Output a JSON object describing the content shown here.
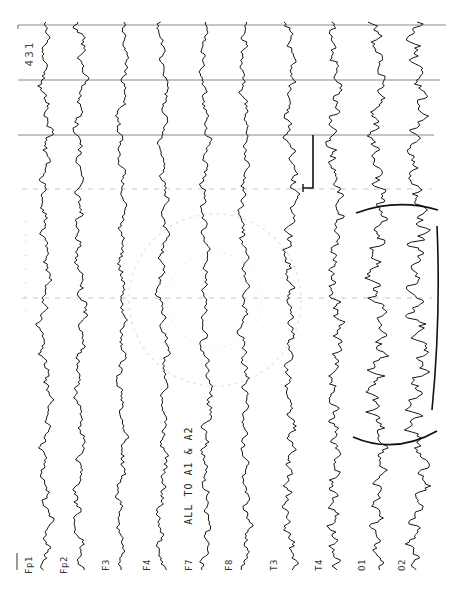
{
  "page": {
    "page_number": "431",
    "montage_label": "ALL TO A1 & A2",
    "faint_note": "· · ·  · ·  ·· ·"
  },
  "channels": [
    {
      "label": "Fp1",
      "x": 45,
      "amp": 4.5,
      "freq": 1.0,
      "seed": 11
    },
    {
      "label": "Fp2",
      "x": 80,
      "amp": 4.5,
      "freq": 0.9,
      "seed": 23
    },
    {
      "label": "F3",
      "x": 122,
      "amp": 3.8,
      "freq": 0.8,
      "seed": 37
    },
    {
      "label": "F4",
      "x": 163,
      "amp": 3.8,
      "freq": 0.8,
      "seed": 41
    },
    {
      "label": "F7",
      "x": 205,
      "amp": 3.6,
      "freq": 1.1,
      "seed": 53
    },
    {
      "label": "F8",
      "x": 245,
      "amp": 3.8,
      "freq": 1.0,
      "seed": 67
    },
    {
      "label": "T3",
      "x": 290,
      "amp": 4.6,
      "freq": 1.3,
      "seed": 79
    },
    {
      "label": "T4",
      "x": 335,
      "amp": 5.2,
      "freq": 1.4,
      "seed": 83
    },
    {
      "label": "O1",
      "x": 378,
      "amp": 6.2,
      "freq": 1.3,
      "seed": 97
    },
    {
      "label": "O2",
      "x": 418,
      "amp": 7.0,
      "freq": 1.3,
      "seed": 101
    }
  ],
  "grid": {
    "solid_lines_y": [
      25,
      80,
      135
    ],
    "dashed_lines_y": [
      189,
      298
    ],
    "trace_top": 22,
    "trace_bottom": 570,
    "ink_color": "#1a1a1a",
    "grid_color": "#888888"
  },
  "annotations": {
    "calibration": {
      "x": 313,
      "y1": 135,
      "y2": 188,
      "x_end": 303
    },
    "top_arc": {
      "x1": 356,
      "y1": 213,
      "x2": 438,
      "y2": 210,
      "cy": 198
    },
    "bottom_arc": {
      "x1": 353,
      "y1": 437,
      "x2": 437,
      "y2": 431,
      "cy": 455
    },
    "right_bracket": {
      "x1": 437,
      "y1": 226,
      "x2": 432,
      "y2": 410,
      "cx": 441
    }
  },
  "stamp": {
    "cx": 215,
    "cy": 300,
    "r": 86
  }
}
